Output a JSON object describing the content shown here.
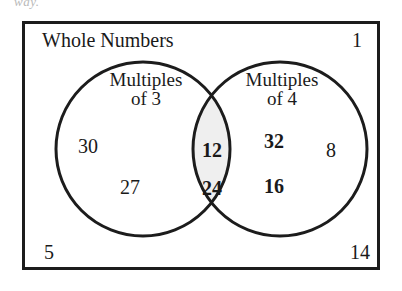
{
  "figure": {
    "type": "venn-diagram",
    "clipped_text_above": "way.",
    "universe_label": "Whole Numbers",
    "sets": [
      {
        "id": "multiples-of-3",
        "label_line1": "Multiples",
        "label_line2": "of 3"
      },
      {
        "id": "multiples-of-4",
        "label_line1": "Multiples",
        "label_line2": "of 4"
      }
    ],
    "regions": {
      "left_only": [
        "30",
        "27"
      ],
      "intersection": [
        "12",
        "24"
      ],
      "right_only": [
        "32",
        "16",
        "8"
      ],
      "outside": [
        "1",
        "5",
        "14"
      ]
    },
    "elements": {
      "n30": "30",
      "n27": "27",
      "n12": "12",
      "n24": "24",
      "n32": "32",
      "n16": "16",
      "n8": "8",
      "n1": "1",
      "n5": "5",
      "n14": "14"
    },
    "colors": {
      "stroke": "#1c1c1c",
      "intersection_fill": "#efefef",
      "background": "#ffffff",
      "text": "#1a1a1a"
    }
  }
}
